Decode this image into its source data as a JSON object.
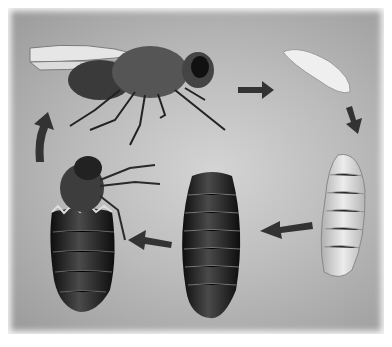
{
  "diagram": {
    "title": "",
    "type": "life-cycle",
    "stages": [
      {
        "id": "adult",
        "label": "adult fly"
      },
      {
        "id": "egg",
        "label": "egg"
      },
      {
        "id": "larva",
        "label": "larva (maggot)"
      },
      {
        "id": "pupa",
        "label": "pupa"
      },
      {
        "id": "emerging",
        "label": "adult emerging from pupal case"
      }
    ],
    "arrows": [
      {
        "from": "adult",
        "to": "egg"
      },
      {
        "from": "egg",
        "to": "larva"
      },
      {
        "from": "larva",
        "to": "pupa"
      },
      {
        "from": "pupa",
        "to": "emerging"
      },
      {
        "from": "emerging",
        "to": "adult"
      }
    ],
    "colors": {
      "background": "#b8b8b8",
      "arrow": "#333333",
      "pupa": "#1e1e1e",
      "larva": "#dcdcdc",
      "egg": "#eeeeee"
    }
  }
}
